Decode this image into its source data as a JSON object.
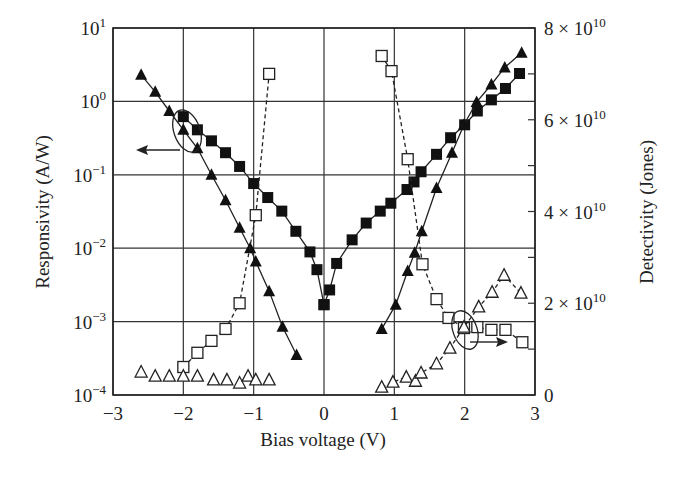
{
  "chart_data": {
    "type": "scatter",
    "title": "",
    "xlabel": "Bias voltage (V)",
    "ylabel": "Responsivity (A/W)",
    "y2label": "Detectivity (Jones)",
    "xlim": [
      -3,
      3
    ],
    "ylim": [
      0.0001,
      10
    ],
    "yscale": "log",
    "y2lim": [
      0,
      80000000000.0
    ],
    "y2scale": "linear",
    "grid": true,
    "x_ticks": [
      "-3",
      "-2",
      "-1",
      "0",
      "1",
      "2",
      "3"
    ],
    "y_ticks": [
      {
        "base": "10",
        "exp": "1"
      },
      {
        "base": "10",
        "exp": "0"
      },
      {
        "base": "10",
        "exp": "-1"
      },
      {
        "base": "10",
        "exp": "-2"
      },
      {
        "base": "10",
        "exp": "-3"
      },
      {
        "base": "10",
        "exp": "-4"
      }
    ],
    "y2_ticks": [
      {
        "label": "8 × 10",
        "exp": "10",
        "value": 80000000000.0
      },
      {
        "label": "6 × 10",
        "exp": "10",
        "value": 60000000000.0
      },
      {
        "label": "4 × 10",
        "exp": "10",
        "value": 40000000000.0
      },
      {
        "label": "2 × 10",
        "exp": "10",
        "value": 20000000000.0
      },
      {
        "label": "0",
        "exp": "",
        "value": 0
      }
    ],
    "series": [
      {
        "name": "Responsivity (filled squares)",
        "axis": "left",
        "marker": "filled-square",
        "line": "solid",
        "segments": [
          {
            "x": [
              -2.0,
              -1.8,
              -1.6,
              -1.4,
              -1.2,
              -1.0,
              -0.8,
              -0.6,
              -0.4,
              -0.2,
              -0.1,
              0.0
            ],
            "y": [
              0.62,
              0.41,
              0.29,
              0.2,
              0.13,
              0.076,
              0.049,
              0.032,
              0.017,
              0.0089,
              0.0051,
              0.0017
            ]
          },
          {
            "x": [
              0.0,
              0.08,
              0.18,
              0.4,
              0.6,
              0.8,
              0.95,
              1.18,
              1.28,
              1.38,
              1.6,
              1.8,
              2.0,
              2.18,
              2.38,
              2.58,
              2.78
            ],
            "y": [
              0.0017,
              0.0027,
              0.0062,
              0.013,
              0.022,
              0.032,
              0.041,
              0.063,
              0.08,
              0.11,
              0.19,
              0.32,
              0.48,
              0.74,
              1.05,
              1.5,
              2.4
            ]
          }
        ]
      },
      {
        "name": "Responsivity (filled triangles)",
        "axis": "left",
        "marker": "filled-triangle",
        "line": "solid",
        "segments": [
          {
            "x": [
              -2.6,
              -2.4,
              -2.2,
              -2.0,
              -1.8,
              -1.6,
              -1.4,
              -1.2,
              -1.05,
              -0.97,
              -0.78,
              -0.59,
              -0.39
            ],
            "y": [
              2.3,
              1.35,
              0.74,
              0.41,
              0.23,
              0.1,
              0.045,
              0.019,
              0.01,
              0.0066,
              0.0026,
              0.00085,
              0.00035
            ]
          },
          {
            "x": [
              0.82,
              1.02,
              1.19,
              1.29,
              1.39,
              1.6,
              1.82,
              1.99,
              2.17,
              2.38,
              2.57,
              2.81
            ],
            "y": [
              0.00079,
              0.0017,
              0.0049,
              0.0087,
              0.017,
              0.066,
              0.2,
              0.48,
              0.98,
              1.7,
              2.9,
              4.6
            ]
          }
        ]
      },
      {
        "name": "Detectivity (open squares)",
        "axis": "right",
        "marker": "open-square",
        "line": "dashed",
        "segments": [
          {
            "x": [
              -2.0,
              -1.8,
              -1.6,
              -1.4,
              -1.2,
              -0.97,
              -0.78
            ],
            "y": [
              6100000000.0,
              9200000000.0,
              11800000000.0,
              14400000000.0,
              20000000000.0,
              39200000000.0,
              70000000000.0
            ]
          },
          {
            "x": [
              0.82,
              0.96,
              1.19,
              1.4,
              1.6,
              1.77,
              1.99,
              2.18,
              2.38,
              2.58,
              2.82
            ],
            "y": [
              73900000000.0,
              70600000000.0,
              51400000000.0,
              28500000000.0,
              20900000000.0,
              16800000000.0,
              14600000000.0,
              14800000000.0,
              14200000000.0,
              14200000000.0,
              11500000000.0
            ]
          }
        ]
      },
      {
        "name": "Detectivity (open triangles)",
        "axis": "right",
        "marker": "open-triangle",
        "line": "none-left / dashed-right",
        "segments": [
          {
            "x": [
              -2.6,
              -2.4,
              -2.2,
              -2.0,
              -1.8,
              -1.57,
              -1.38,
              -1.2,
              -1.08,
              -0.97,
              -0.78
            ],
            "y": [
              5000000000.0,
              4100000000.0,
              4100000000.0,
              4100000000.0,
              4100000000.0,
              3300000000.0,
              3300000000.0,
              2600000000.0,
              4100000000.0,
              3300000000.0,
              3300000000.0
            ],
            "line": "none"
          },
          {
            "x": [
              0.82,
              0.98,
              1.17,
              1.3,
              1.38,
              1.6,
              1.79,
              1.99,
              2.2,
              2.39,
              2.56,
              2.8
            ],
            "y": [
              1700000000.0,
              2800000000.0,
              3900000000.0,
              3000000000.0,
              4800000000.0,
              6800000000.0,
              10200000000.0,
              14800000000.0,
              19200000000.0,
              22400000000.0,
              26100000000.0,
              22200000000.0
            ],
            "line": "dashed"
          }
        ]
      }
    ],
    "annotations": [
      {
        "type": "ellipse-with-arrow",
        "direction": "left",
        "meaning": "filled markers refer to left axis (Responsivity)",
        "at_x": -1.95
      },
      {
        "type": "ellipse-with-arrow",
        "direction": "right",
        "meaning": "open markers refer to right axis (Detectivity)",
        "at_x": 1.95
      }
    ]
  }
}
